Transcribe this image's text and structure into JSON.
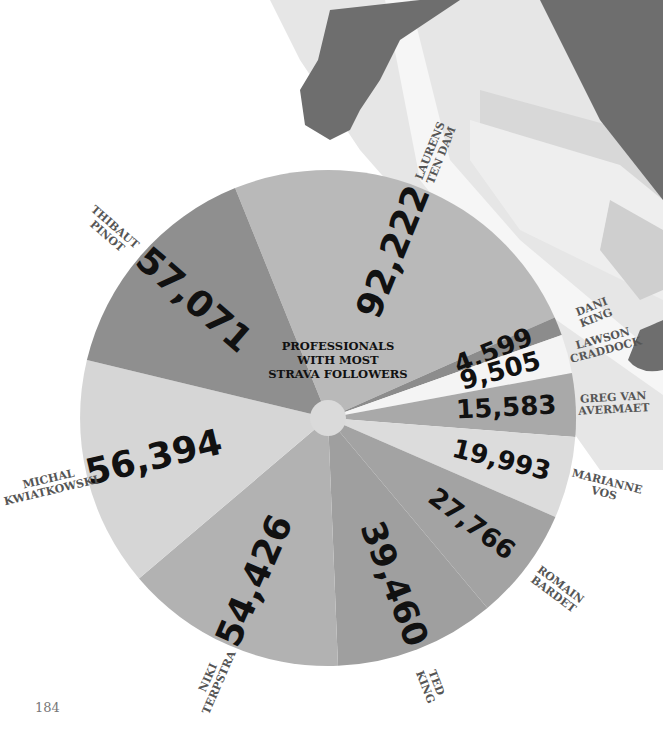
{
  "page_number": "184",
  "chart_data": {
    "type": "pie",
    "title_lines": [
      "PROFESSIONALS",
      "WITH MOST",
      "STRAVA FOLLOWERS"
    ],
    "slices": [
      {
        "name": "LAURENS TEN DAM",
        "name_lines": [
          "LAURENS",
          "TEN DAM"
        ],
        "value": 92222,
        "label": "92,222",
        "color": "#b9b9b9"
      },
      {
        "name": "DANI KING",
        "name_lines": [
          "DANI",
          "KING"
        ],
        "value": 4599,
        "label": "4,599",
        "color": "#8c8c8c"
      },
      {
        "name": "LAWSON CRADDOCK",
        "name_lines": [
          "LAWSON",
          "CRADDOCK"
        ],
        "value": 9505,
        "label": "9,505",
        "color": "#f4f4f4"
      },
      {
        "name": "GREG VAN AVERMAET",
        "name_lines": [
          "GREG VAN",
          "AVERMAET"
        ],
        "value": 15583,
        "label": "15,583",
        "color": "#a9a9a9"
      },
      {
        "name": "MARIANNE VOS",
        "name_lines": [
          "MARIANNE",
          "VOS"
        ],
        "value": 19993,
        "label": "19,993",
        "color": "#dcdcdc"
      },
      {
        "name": "ROMAIN BARDET",
        "name_lines": [
          "ROMAIN",
          "BARDET"
        ],
        "value": 27766,
        "label": "27,766",
        "color": "#a3a3a3"
      },
      {
        "name": "TED KING",
        "name_lines": [
          "TED",
          "KING"
        ],
        "value": 39460,
        "label": "39,460",
        "color": "#9f9f9f"
      },
      {
        "name": "NIKI TERPSTRA",
        "name_lines": [
          "NIKI",
          "TERPSTRA"
        ],
        "value": 54426,
        "label": "54,426",
        "color": "#b2b2b2"
      },
      {
        "name": "MICHAL KWIATKOWSKI",
        "name_lines": [
          "MICHAL",
          "KWIATKOWSKI"
        ],
        "value": 56394,
        "label": "56,394",
        "color": "#d6d6d6"
      },
      {
        "name": "THIBAUT PINOT",
        "name_lines": [
          "THIBAUT",
          "PINOT"
        ],
        "value": 57071,
        "label": "57,071",
        "color": "#8f8f8f"
      }
    ],
    "total": 377019,
    "legend": "none (labels placed outside slices)",
    "background": "grey silhouette of cyclist and bicycle frame"
  }
}
